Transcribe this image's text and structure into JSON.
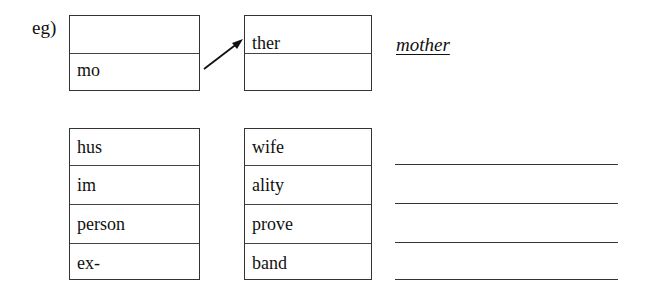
{
  "example": {
    "label": "eg)",
    "left_box": [
      "",
      "mo"
    ],
    "right_box": [
      "ther",
      ""
    ],
    "answer": "mother"
  },
  "exercise": {
    "left_column": [
      "hus",
      "im",
      "person",
      "ex-"
    ],
    "right_column": [
      "wife",
      "ality",
      "prove",
      "band"
    ],
    "answers": [
      "",
      "",
      "",
      ""
    ]
  }
}
